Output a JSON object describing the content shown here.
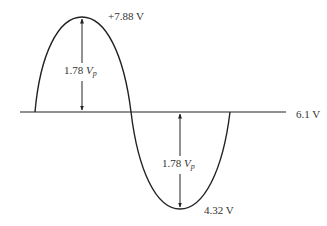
{
  "diagram": {
    "type": "sine waveform with DC offset",
    "dc_level_label": "6.1 V",
    "positive_peak_label": "+7.88 V",
    "negative_peak_label": "4.32 V",
    "upper_amplitude": {
      "value": "1.78",
      "symbol": "V",
      "subscript": "p"
    },
    "lower_amplitude": {
      "value": "1.78",
      "symbol": "V",
      "subscript": "p"
    },
    "colors": {
      "line": "#222222",
      "text": "#333333",
      "background": "#ffffff"
    }
  }
}
